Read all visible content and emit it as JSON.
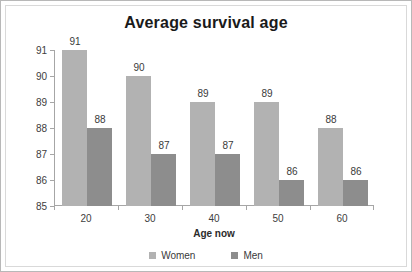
{
  "chart_data": {
    "type": "bar",
    "title": "Average survival age",
    "xlabel": "Age now",
    "ylabel": "",
    "categories": [
      "20",
      "30",
      "40",
      "50",
      "60"
    ],
    "series": [
      {
        "name": "Women",
        "values": [
          91,
          90,
          89,
          89,
          88
        ],
        "color": "#b2b2b2"
      },
      {
        "name": "Men",
        "values": [
          88,
          87,
          87,
          86,
          86
        ],
        "color": "#8d8d8d"
      }
    ],
    "ylim": [
      85,
      91
    ],
    "yticks": [
      91,
      90,
      89,
      88,
      87,
      86,
      85
    ],
    "ytick_labels": [
      "91",
      "90",
      "89",
      "88",
      "87",
      "86",
      "85"
    ],
    "grid": false,
    "legend_position": "bottom",
    "data_labels": true,
    "axis_color": "#a6a6a6",
    "background": "#ffffff"
  },
  "legend": {
    "items": [
      {
        "label": "Women",
        "color": "#b2b2b2"
      },
      {
        "label": "Men",
        "color": "#8d8d8d"
      }
    ]
  }
}
